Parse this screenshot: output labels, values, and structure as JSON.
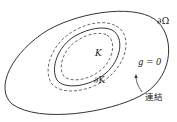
{
  "diagram": {
    "labels": {
      "outer_boundary": "∂Ω",
      "set": "K",
      "set_boundary": "∂K",
      "condition": "g = 0",
      "arrow_note": "連結"
    },
    "colors": {
      "stroke": "#333333",
      "text": "#222222",
      "background": "#ffffff"
    }
  }
}
